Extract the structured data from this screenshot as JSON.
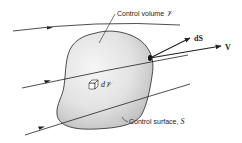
{
  "diagram": {
    "labels": {
      "control_volume": "Control volume",
      "control_volume_symbol": "𝒱",
      "control_surface": "Control surface,",
      "control_surface_symbol": "S",
      "dS": "dS",
      "V": "V",
      "dV_prefix": "d",
      "dV_symbol": "𝒱"
    },
    "elements": {
      "streamlines": 3,
      "vectors": [
        "dS",
        "V"
      ]
    },
    "colors": {
      "outline": "#222222",
      "body_fill": "#d9d9d9",
      "highlight": "#f4f4f4",
      "background": "#ffffff"
    }
  }
}
